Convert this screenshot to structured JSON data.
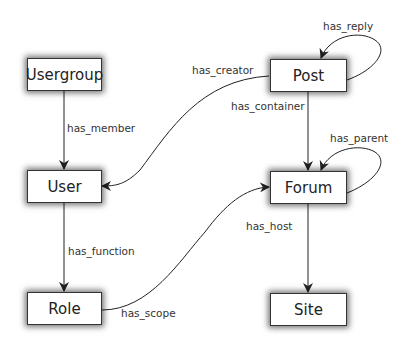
{
  "nodes": {
    "usergroup": "Usergroup",
    "user": "User",
    "role": "Role",
    "post": "Post",
    "forum": "Forum",
    "site": "Site"
  },
  "edges": {
    "has_member": "has_member",
    "has_function": "has_function",
    "has_scope": "has_scope",
    "has_creator": "has_creator",
    "has_container": "has_container",
    "has_reply": "has_reply",
    "has_parent": "has_parent",
    "has_host": "has_host"
  }
}
